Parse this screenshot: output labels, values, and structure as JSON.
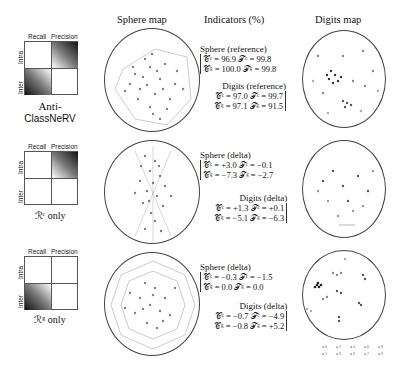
{
  "headers": {
    "sphere_map": "Sphere map",
    "indicators": "Indicators (%)",
    "digits_map": "Digits map"
  },
  "quadrant_labels": {
    "recall": "Recall",
    "precision": "Precision",
    "intra": "Intra",
    "inter": "Inter"
  },
  "rows": [
    {
      "caption_line1": "Anti-",
      "caption_line2": "ClassNeRV",
      "sphere_title": "Sphere (reference)",
      "sphere_line1": "𝒞ᶜ = 96.9  𝒯ᶜ = 99.8",
      "sphere_line2": "𝒞ᵍ = 100.0  𝒯ᵍ = 99.8",
      "digits_title": "Digits (reference)",
      "digits_line1": "𝒞ᶜ = 97.0  𝒯ᶜ = 99.7",
      "digits_line2": "𝒞ᵍ = 97.1  𝒯ᵍ = 91.5"
    },
    {
      "caption": "ℛᶜ only",
      "sphere_title": "Sphere (delta)",
      "sphere_line1": "𝒞ᶜ = +3.0  𝒯ᶜ = −0.1",
      "sphere_line2": "𝒞ᵍ = −7.3  𝒯ᵍ = −2.7",
      "digits_title": "Digits (delta)",
      "digits_line1": "𝒞ᶜ = +1.3  𝒯ᶜ = +0.1",
      "digits_line2": "𝒞ᵍ = −5.1  𝒯ᵍ = −6.3"
    },
    {
      "caption": "ℛᵍ only",
      "sphere_title": "Sphere (delta)",
      "sphere_line1": "𝒞ᶜ = −0.3  𝒯ᶜ = −1.5",
      "sphere_line2": "𝒞ᵍ = 0.0  𝒯ᵍ = 0.0",
      "digits_title": "Digits (delta)",
      "digits_line1": "𝒞ᶜ = −0.7  𝒯ᶜ = −4.9",
      "digits_line2": "𝒞ᵍ = −0.8  𝒯ᵍ = +5.2"
    }
  ],
  "legend": {
    "items": [
      "0",
      "2",
      "4",
      "6",
      "8",
      "1",
      "3",
      "5",
      "7",
      "9"
    ]
  }
}
